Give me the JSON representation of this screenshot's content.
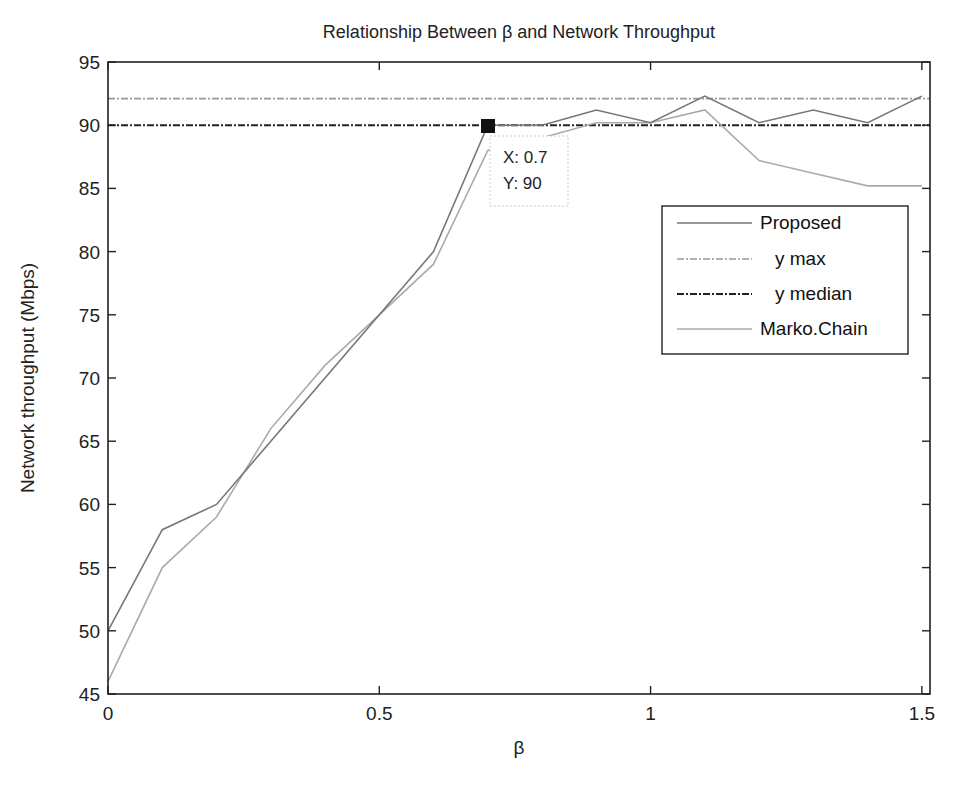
{
  "chart_data": {
    "type": "line",
    "title": "Relationship Between β and Network Throughput",
    "xlabel": "β",
    "ylabel": "Network throughput (Mbps)",
    "xlim": [
      0,
      1.515
    ],
    "ylim": [
      45,
      95
    ],
    "x_ticks": [
      0,
      0.5,
      1,
      1.5
    ],
    "x_tick_labels": [
      "0",
      "0.5",
      "1",
      "1.5"
    ],
    "y_ticks": [
      45,
      50,
      55,
      60,
      65,
      70,
      75,
      80,
      85,
      90,
      95
    ],
    "y_tick_labels": [
      "45",
      "50",
      "55",
      "60",
      "65",
      "70",
      "75",
      "80",
      "85",
      "90",
      "95"
    ],
    "grid": false,
    "legend_position": "upper right (inside)",
    "x": [
      0,
      0.1,
      0.2,
      0.3,
      0.4,
      0.5,
      0.6,
      0.7,
      0.8,
      0.9,
      1.0,
      1.1,
      1.2,
      1.3,
      1.4,
      1.5
    ],
    "series": [
      {
        "name": "Proposed",
        "style": "solid",
        "color": "#777777",
        "values": [
          50,
          58,
          60,
          65,
          70,
          75,
          80,
          90,
          90,
          91.2,
          90.2,
          92.3,
          90.2,
          91.2,
          90.2,
          92.3
        ]
      },
      {
        "name": "y max",
        "style": "dashdot",
        "color": "#999999",
        "values": [
          92.1,
          92.1,
          92.1,
          92.1,
          92.1,
          92.1,
          92.1,
          92.1,
          92.1,
          92.1,
          92.1,
          92.1,
          92.1,
          92.1,
          92.1,
          92.1
        ]
      },
      {
        "name": "y median",
        "style": "dashdot",
        "color": "#222222",
        "values": [
          90,
          90,
          90,
          90,
          90,
          90,
          90,
          90,
          90,
          90,
          90,
          90,
          90,
          90,
          90,
          90
        ]
      },
      {
        "name": "Marko.Chain",
        "style": "solid",
        "color": "#aaaaaa",
        "values": [
          46,
          55,
          59,
          66,
          71,
          75,
          79,
          88,
          89,
          90.2,
          90.2,
          91.2,
          87.2,
          86.2,
          85.2,
          85.2
        ]
      }
    ],
    "annotations": [
      {
        "type": "datatip",
        "x": 0.7,
        "y": 90,
        "lines": [
          "X: 0.7",
          "Y: 90"
        ]
      }
    ]
  },
  "legend": {
    "items": [
      {
        "label": "Proposed"
      },
      {
        "label": "y max"
      },
      {
        "label": "y median"
      },
      {
        "label": "Marko.Chain"
      }
    ]
  },
  "datatip": {
    "x_text": "X: 0.7",
    "y_text": "Y: 90"
  }
}
